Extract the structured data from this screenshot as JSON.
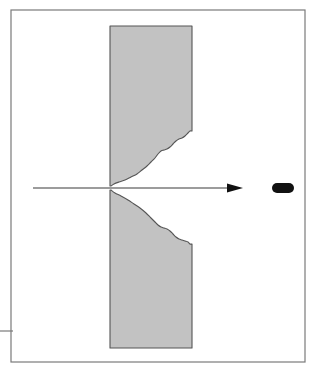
{
  "figure": {
    "kind": "technical-line-diagram",
    "background_color": "#ffffff",
    "canvas": {
      "width": 324,
      "height": 380
    }
  },
  "frame": {
    "name": "outer-border",
    "stroke_color": "#7a7a7a",
    "stroke_width": 1.2,
    "x": 11,
    "y": 10,
    "width": 294,
    "height": 352
  },
  "stray_rule": {
    "name": "left-margin-rule",
    "stroke_color": "#7a7a7a",
    "stroke_width": 1.2,
    "x1": 0,
    "y1": 331,
    "x2": 13,
    "y2": 331
  },
  "target_plate": {
    "name": "target-plate",
    "fill_color": "#c2c2c2",
    "stroke_color": "#555555",
    "stroke_width": 1.1,
    "left": 110,
    "right": 192,
    "top": 26,
    "bottom": 348,
    "thickness": 82,
    "height": 322
  },
  "cavity": {
    "name": "penetration-cavity",
    "fill_color": "#ffffff",
    "entry_x": 111,
    "axis_y": 188,
    "exit_x": 192,
    "upper_exit_y": 131,
    "lower_exit_y": 244,
    "exit_opening": 113,
    "upper_profile": [
      [
        111,
        186
      ],
      [
        114,
        184
      ],
      [
        119,
        182
      ],
      [
        125,
        180
      ],
      [
        131,
        177
      ],
      [
        137,
        174
      ],
      [
        142,
        170
      ],
      [
        147,
        166
      ],
      [
        151,
        162
      ],
      [
        155,
        158
      ],
      [
        158,
        154
      ],
      [
        161,
        151
      ],
      [
        164,
        150
      ],
      [
        167,
        149
      ],
      [
        170,
        147
      ],
      [
        173,
        144
      ],
      [
        176,
        141
      ],
      [
        179,
        139
      ],
      [
        182,
        138
      ],
      [
        185,
        136
      ],
      [
        188,
        133
      ],
      [
        190,
        131
      ],
      [
        192,
        131
      ]
    ],
    "lower_profile": [
      [
        111,
        190
      ],
      [
        115,
        193
      ],
      [
        121,
        196
      ],
      [
        128,
        200
      ],
      [
        134,
        204
      ],
      [
        140,
        208
      ],
      [
        146,
        213
      ],
      [
        151,
        218
      ],
      [
        155,
        222
      ],
      [
        158,
        225
      ],
      [
        161,
        227
      ],
      [
        164,
        228
      ],
      [
        167,
        229
      ],
      [
        170,
        231
      ],
      [
        173,
        234
      ],
      [
        176,
        237
      ],
      [
        179,
        239
      ],
      [
        182,
        240
      ],
      [
        185,
        241
      ],
      [
        188,
        242
      ],
      [
        190,
        244
      ],
      [
        192,
        244
      ]
    ]
  },
  "trajectory_axis": {
    "name": "trajectory-axis",
    "stroke_color": "#3a3a3a",
    "stroke_width": 1.2,
    "y": 188,
    "x_start": 33,
    "x_end": 228,
    "arrowhead": {
      "name": "direction-arrowhead",
      "fill_color": "#111111",
      "tip_x": 243,
      "base_x": 227,
      "half_height": 4.5
    }
  },
  "projectile": {
    "name": "projectile",
    "fill_color": "#111111",
    "x": 272,
    "y": 183,
    "width": 22,
    "height": 10,
    "nose_radius": 5
  },
  "colors": {
    "plate_gray": "#c2c2c2",
    "plate_outline": "#555555",
    "frame_gray": "#7a7a7a",
    "ink_black": "#111111",
    "axis_gray": "#3a3a3a",
    "paper_white": "#ffffff"
  },
  "labels": {
    "title": "",
    "entry_face": "",
    "exit_face": "",
    "notes": ""
  }
}
